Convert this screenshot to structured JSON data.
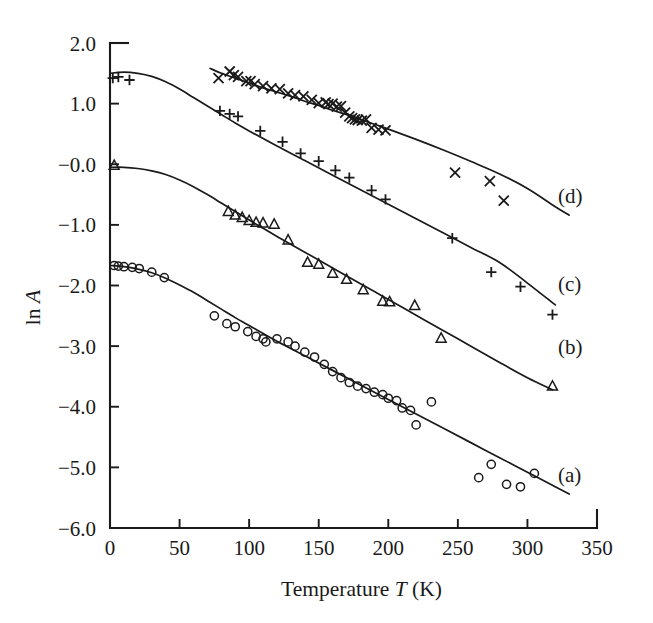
{
  "chart_data": {
    "type": "scatter",
    "title": "",
    "xlabel": "Temperature T (K)",
    "xlabel_parts": {
      "pre": "Temperature",
      "symbol": "T",
      "post": "(K)"
    },
    "ylabel": "ln A",
    "ylabel_parts": {
      "pre": "ln",
      "symbol": "A"
    },
    "xlim": [
      0,
      350
    ],
    "ylim": [
      -6.0,
      2.0
    ],
    "grid": false,
    "legend_position": "right-inline",
    "xticks": [
      0,
      50,
      100,
      150,
      200,
      250,
      300,
      350
    ],
    "xtick_labels": [
      "0",
      "50",
      "100",
      "150",
      "200",
      "250",
      "300",
      "350"
    ],
    "yticks": [
      2.0,
      1.0,
      0.0,
      -1.0,
      -2.0,
      -3.0,
      -4.0,
      -5.0,
      -6.0
    ],
    "ytick_labels": [
      "2.0",
      "1.0",
      "−0.0",
      "−1.0",
      "−2.0",
      "−3.0",
      "−4.0",
      "−5.0",
      "−6.0"
    ],
    "series": [
      {
        "name": "(a)",
        "label": "(a)",
        "marker": "circle",
        "label_x": 322,
        "label_y": -5.12,
        "points": [
          [
            3,
            -1.67
          ],
          [
            6,
            -1.68
          ],
          [
            10,
            -1.69
          ],
          [
            16,
            -1.7
          ],
          [
            21,
            -1.72
          ],
          [
            30,
            -1.78
          ],
          [
            39,
            -1.87
          ],
          [
            75,
            -2.5
          ],
          [
            84,
            -2.63
          ],
          [
            90,
            -2.68
          ],
          [
            99,
            -2.76
          ],
          [
            105,
            -2.84
          ],
          [
            110,
            -2.88
          ],
          [
            112,
            -2.93
          ],
          [
            120,
            -2.88
          ],
          [
            128,
            -2.93
          ],
          [
            133,
            -3.0
          ],
          [
            140,
            -3.1
          ],
          [
            147,
            -3.18
          ],
          [
            154,
            -3.3
          ],
          [
            160,
            -3.42
          ],
          [
            166,
            -3.52
          ],
          [
            172,
            -3.6
          ],
          [
            178,
            -3.66
          ],
          [
            184,
            -3.7
          ],
          [
            190,
            -3.76
          ],
          [
            196,
            -3.8
          ],
          [
            200,
            -3.86
          ],
          [
            206,
            -3.9
          ],
          [
            210,
            -4.02
          ],
          [
            216,
            -4.06
          ],
          [
            220,
            -4.3
          ],
          [
            231,
            -3.92
          ],
          [
            265,
            -5.17
          ],
          [
            274,
            -4.95
          ],
          [
            285,
            -5.28
          ],
          [
            295,
            -5.32
          ],
          [
            305,
            -5.1
          ]
        ],
        "fit": [
          [
            0,
            -1.67
          ],
          [
            10,
            -1.69
          ],
          [
            20,
            -1.73
          ],
          [
            30,
            -1.79
          ],
          [
            40,
            -1.88
          ],
          [
            50,
            -1.99
          ],
          [
            60,
            -2.11
          ],
          [
            70,
            -2.25
          ],
          [
            80,
            -2.39
          ],
          [
            90,
            -2.53
          ],
          [
            100,
            -2.66
          ],
          [
            120,
            -2.92
          ],
          [
            140,
            -3.16
          ],
          [
            160,
            -3.4
          ],
          [
            180,
            -3.64
          ],
          [
            200,
            -3.88
          ],
          [
            220,
            -4.12
          ],
          [
            240,
            -4.36
          ],
          [
            260,
            -4.6
          ],
          [
            280,
            -4.84
          ],
          [
            300,
            -5.08
          ],
          [
            320,
            -5.32
          ],
          [
            330,
            -5.44
          ]
        ]
      },
      {
        "name": "(b)",
        "label": "(b)",
        "marker": "triangle",
        "label_x": 322,
        "label_y": -3.02,
        "points": [
          [
            3,
            -0.02
          ],
          [
            85,
            -0.78
          ],
          [
            90,
            -0.84
          ],
          [
            95,
            -0.88
          ],
          [
            100,
            -0.93
          ],
          [
            105,
            -0.96
          ],
          [
            110,
            -0.97
          ],
          [
            118,
            -0.99
          ],
          [
            128,
            -1.25
          ],
          [
            142,
            -1.62
          ],
          [
            150,
            -1.65
          ],
          [
            160,
            -1.8
          ],
          [
            170,
            -1.9
          ],
          [
            182,
            -2.07
          ],
          [
            196,
            -2.26
          ],
          [
            201,
            -2.27
          ],
          [
            219,
            -2.33
          ],
          [
            238,
            -2.87
          ],
          [
            318,
            -3.66
          ]
        ],
        "fit": [
          [
            0,
            -0.05
          ],
          [
            10,
            -0.05
          ],
          [
            20,
            -0.07
          ],
          [
            30,
            -0.11
          ],
          [
            40,
            -0.17
          ],
          [
            50,
            -0.26
          ],
          [
            60,
            -0.37
          ],
          [
            70,
            -0.5
          ],
          [
            80,
            -0.64
          ],
          [
            90,
            -0.78
          ],
          [
            100,
            -0.92
          ],
          [
            120,
            -1.19
          ],
          [
            140,
            -1.45
          ],
          [
            160,
            -1.71
          ],
          [
            180,
            -1.97
          ],
          [
            200,
            -2.23
          ],
          [
            220,
            -2.49
          ],
          [
            240,
            -2.75
          ],
          [
            260,
            -3.01
          ],
          [
            280,
            -3.27
          ],
          [
            300,
            -3.52
          ],
          [
            318,
            -3.72
          ]
        ]
      },
      {
        "name": "(c)",
        "label": "(c)",
        "marker": "plus",
        "label_x": 322,
        "label_y": -1.98,
        "points": [
          [
            2,
            1.42
          ],
          [
            6,
            1.44
          ],
          [
            14,
            1.39
          ],
          [
            79,
            0.88
          ],
          [
            86,
            0.83
          ],
          [
            92,
            0.79
          ],
          [
            108,
            0.55
          ],
          [
            124,
            0.37
          ],
          [
            137,
            0.18
          ],
          [
            150,
            0.05
          ],
          [
            162,
            -0.1
          ],
          [
            172,
            -0.22
          ],
          [
            188,
            -0.43
          ],
          [
            198,
            -0.58
          ],
          [
            246,
            -1.22
          ],
          [
            274,
            -1.78
          ],
          [
            295,
            -2.02
          ],
          [
            318,
            -2.48
          ]
        ],
        "fit": [
          [
            0,
            1.5
          ],
          [
            10,
            1.52
          ],
          [
            20,
            1.5
          ],
          [
            30,
            1.45
          ],
          [
            40,
            1.36
          ],
          [
            50,
            1.24
          ],
          [
            60,
            1.1
          ],
          [
            70,
            0.96
          ],
          [
            80,
            0.82
          ],
          [
            90,
            0.68
          ],
          [
            100,
            0.55
          ],
          [
            120,
            0.3
          ],
          [
            140,
            0.06
          ],
          [
            160,
            -0.18
          ],
          [
            180,
            -0.42
          ],
          [
            200,
            -0.66
          ],
          [
            220,
            -0.9
          ],
          [
            240,
            -1.14
          ],
          [
            260,
            -1.38
          ],
          [
            280,
            -1.62
          ],
          [
            300,
            -1.96
          ],
          [
            320,
            -2.32
          ]
        ]
      },
      {
        "name": "(d)",
        "label": "(d)",
        "marker": "cross",
        "label_x": 322,
        "label_y": -0.52,
        "points": [
          [
            78,
            1.42
          ],
          [
            86,
            1.53
          ],
          [
            89,
            1.47
          ],
          [
            92,
            1.44
          ],
          [
            98,
            1.37
          ],
          [
            101,
            1.37
          ],
          [
            104,
            1.32
          ],
          [
            110,
            1.29
          ],
          [
            116,
            1.25
          ],
          [
            122,
            1.24
          ],
          [
            128,
            1.17
          ],
          [
            133,
            1.14
          ],
          [
            139,
            1.12
          ],
          [
            145,
            1.06
          ],
          [
            150,
            1.01
          ],
          [
            155,
            1.02
          ],
          [
            157,
            0.99
          ],
          [
            160,
            1.0
          ],
          [
            163,
            0.95
          ],
          [
            166,
            0.96
          ],
          [
            169,
            0.85
          ],
          [
            172,
            0.79
          ],
          [
            174,
            0.76
          ],
          [
            176,
            0.74
          ],
          [
            178,
            0.73
          ],
          [
            181,
            0.72
          ],
          [
            184,
            0.74
          ],
          [
            188,
            0.6
          ],
          [
            193,
            0.57
          ],
          [
            198,
            0.56
          ],
          [
            248,
            -0.14
          ],
          [
            273,
            -0.28
          ],
          [
            283,
            -0.6
          ]
        ],
        "fit": [
          [
            72,
            1.58
          ],
          [
            80,
            1.5
          ],
          [
            90,
            1.42
          ],
          [
            100,
            1.34
          ],
          [
            110,
            1.26
          ],
          [
            120,
            1.19
          ],
          [
            130,
            1.12
          ],
          [
            140,
            1.04
          ],
          [
            150,
            0.97
          ],
          [
            160,
            0.89
          ],
          [
            170,
            0.82
          ],
          [
            180,
            0.74
          ],
          [
            190,
            0.66
          ],
          [
            200,
            0.58
          ],
          [
            220,
            0.41
          ],
          [
            240,
            0.23
          ],
          [
            260,
            0.04
          ],
          [
            280,
            -0.16
          ],
          [
            300,
            -0.4
          ],
          [
            320,
            -0.7
          ],
          [
            330,
            -0.84
          ]
        ]
      }
    ]
  }
}
